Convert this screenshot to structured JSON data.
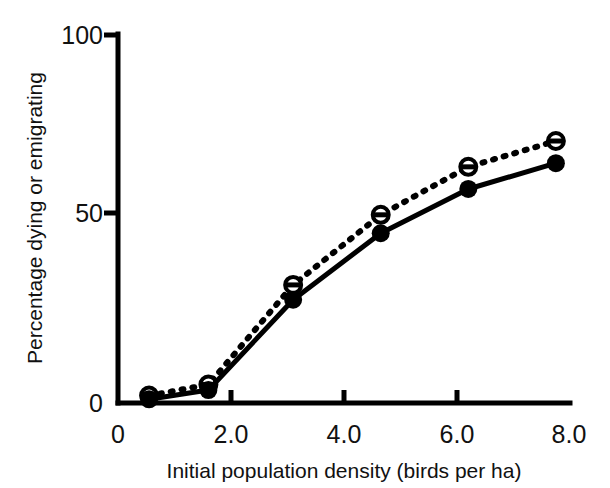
{
  "chart_data": {
    "type": "line",
    "title": "",
    "subtitle": "",
    "xlabel": "Initial population density (birds per ha)",
    "ylabel": "Percentage dying or emigrating",
    "xlim": [
      0,
      8.0
    ],
    "ylim": [
      0,
      100
    ],
    "xticks": [
      0,
      2.0,
      4.0,
      6.0,
      8.0
    ],
    "xtick_labels": [
      "0",
      "2.0",
      "4.0",
      "6.0",
      "8.0"
    ],
    "yticks": [
      0,
      50,
      100
    ],
    "ytick_labels": [
      "0",
      "50",
      "100"
    ],
    "grid": false,
    "legend": "none",
    "x": [
      0.55,
      1.6,
      3.1,
      4.65,
      6.2,
      7.75
    ],
    "series": [
      {
        "name": "solid-filled-circles",
        "line_style": "solid",
        "marker": "filled-circle",
        "color": "#000000",
        "values": [
          1,
          3.5,
          28,
          46,
          58,
          65
        ]
      },
      {
        "name": "dotted-open-circles",
        "line_style": "dotted",
        "marker": "open-circle",
        "color": "#000000",
        "values": [
          2,
          5,
          32,
          51,
          64,
          71
        ]
      }
    ]
  },
  "axes": {
    "y_title": "Percentage dying or emigrating",
    "x_title": "Initial population density (birds per ha)",
    "y_labels": [
      "100",
      "50",
      "0"
    ],
    "x_labels": [
      "0",
      "2.0",
      "4.0",
      "6.0",
      "8.0"
    ],
    "axis_color": "#000000"
  }
}
